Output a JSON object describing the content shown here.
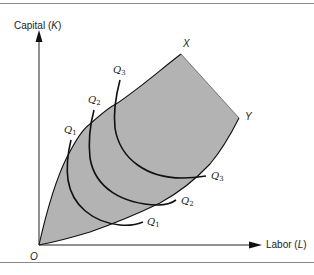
{
  "figure": {
    "type": "isoquant-map-economic-region",
    "axes": {
      "y_label": "Capital",
      "y_symbol": "K",
      "x_label": "Labor",
      "x_symbol": "L",
      "origin_label": "O"
    },
    "boundary_points": {
      "upper_ridge_label": "X",
      "lower_ridge_label": "Y"
    },
    "isoquants": [
      {
        "name": "Q",
        "subscript": "1"
      },
      {
        "name": "Q",
        "subscript": "2"
      },
      {
        "name": "Q",
        "subscript": "3"
      }
    ],
    "colors": {
      "shaded_region": "#b3b3b3",
      "lines": "#111111",
      "rules": "#8a8a8a"
    }
  }
}
